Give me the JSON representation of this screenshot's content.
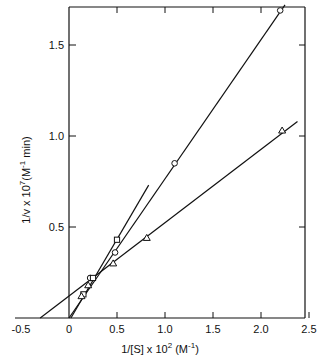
{
  "chart_data": {
    "type": "line",
    "title": "",
    "xlabel": "1/[S] x 10^2 (M^-1)",
    "ylabel": "1/v x 10^7 (M^-1 min)",
    "xlim": [
      -0.5,
      2.5
    ],
    "ylim": [
      0,
      1.7
    ],
    "grid": false,
    "legend": "none",
    "x_ticks": [
      "-0.5",
      "0",
      "0.5",
      "1.0",
      "1.5",
      "2.0",
      "2.5"
    ],
    "y_ticks": [
      "0.5",
      "1.0",
      "1.5"
    ],
    "axis_break": "x-axis break marks near 0",
    "series": [
      {
        "name": "circles",
        "marker": "circle",
        "points": [
          [
            0.22,
            0.22
          ],
          [
            0.48,
            0.36
          ],
          [
            1.1,
            0.85
          ],
          [
            2.2,
            1.69
          ]
        ],
        "fit_line": [
          [
            0.0,
            0.0
          ],
          [
            2.25,
            1.72
          ]
        ]
      },
      {
        "name": "squares",
        "marker": "square",
        "points": [
          [
            0.15,
            0.13
          ],
          [
            0.25,
            0.22
          ],
          [
            0.5,
            0.43
          ]
        ],
        "fit_line": [
          [
            0.02,
            0.0
          ],
          [
            0.83,
            0.73
          ]
        ]
      },
      {
        "name": "triangles",
        "marker": "triangle",
        "points": [
          [
            0.13,
            0.12
          ],
          [
            0.2,
            0.18
          ],
          [
            0.46,
            0.3
          ],
          [
            0.81,
            0.44
          ],
          [
            2.22,
            1.03
          ]
        ],
        "fit_line": [
          [
            -0.3,
            0.0
          ],
          [
            2.38,
            1.08
          ]
        ]
      }
    ]
  },
  "labels": {
    "x_title_main": "1/[S] x 10",
    "x_title_sup": "2",
    "x_title_unit": "(M",
    "x_title_unit_sup": "-1",
    "x_title_close": ")",
    "y_title_main": "1/v x 10",
    "y_title_sup": "7",
    "y_title_unit": "(M",
    "y_title_unit_sup": "-1",
    "y_title_close": " min)"
  }
}
